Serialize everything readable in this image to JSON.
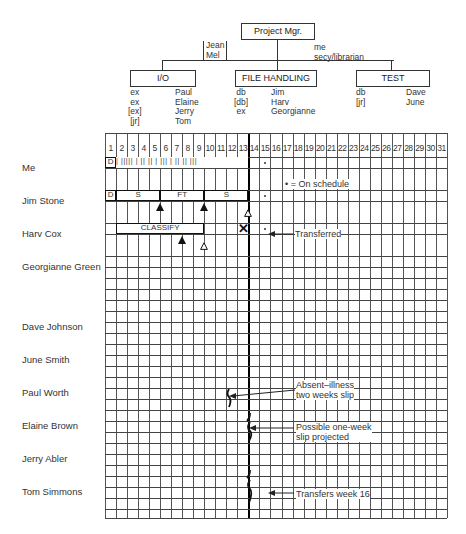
{
  "org_chart": {
    "root": {
      "label": "Project Mgr."
    },
    "root_staff_left": "Jean\nMel",
    "root_staff_right": "me\nsecy/librarian",
    "groups": [
      {
        "label": "I/O",
        "roles": "ex\nex\n[ex]\n[jr]",
        "people": "Paul\nElaine\nJerry\nTom"
      },
      {
        "label": "FILE HANDLING",
        "roles": "db\n[db]\nex",
        "people": "Jim\nHarv\nGeorgianne"
      },
      {
        "label": "TEST",
        "roles": "db\n[jr]",
        "people": "Dave\nJune"
      }
    ]
  },
  "schedule": {
    "weeks": [
      "1",
      "2",
      "3",
      "4",
      "5",
      "6",
      "7",
      "8",
      "9",
      "10",
      "11",
      "12",
      "13",
      "14",
      "15",
      "16",
      "17",
      "18",
      "19",
      "20",
      "21",
      "22",
      "23",
      "24",
      "25",
      "26",
      "27",
      "28",
      "29",
      "30",
      "31"
    ],
    "current_week_line": 13,
    "legend_on_schedule": "• = On schedule",
    "people": [
      {
        "name": "Me"
      },
      {
        "name": "Jim Stone"
      },
      {
        "name": "Harv Cox"
      },
      {
        "name": "Georgianne Green"
      },
      {
        "name": "Dave Johnson"
      },
      {
        "name": "June Smith"
      },
      {
        "name": "Paul Worth"
      },
      {
        "name": "Elaine Brown"
      },
      {
        "name": "Jerry Abler"
      },
      {
        "name": "Tom Simmons"
      }
    ],
    "bars": {
      "me": {
        "d": "D",
        "ticks": "|  ||||| | ||  || |  |||  |  ||  || |||"
      },
      "jim": [
        "D",
        "S",
        "FT",
        "S"
      ],
      "harv": [
        "CLASSIFY"
      ],
      "georgianne": [
        "F1",
        "F2",
        "3",
        "F1",
        "F2",
        "3",
        "ST"
      ],
      "dave": [
        "D",
        "INX",
        "SYS TESTS",
        "ST1",
        "ST"
      ],
      "june": [
        "INX",
        "D1",
        "ST6"
      ],
      "paul": [
        "D",
        "Q",
        "D",
        "Q"
      ],
      "elaine": [
        "E",
        "I",
        "I",
        "D2"
      ],
      "jerry": [
        "RH1",
        "2",
        "E",
        "I1"
      ],
      "tom": [
        "RH1",
        "2",
        "I3",
        "I4",
        "I5"
      ]
    },
    "annotations": {
      "harv": "Transferred",
      "paul": "Absent–illness\ntwo weeks slip",
      "elaine": "Possible one-week\nslip projected",
      "tom": "Transfers week 16"
    }
  }
}
